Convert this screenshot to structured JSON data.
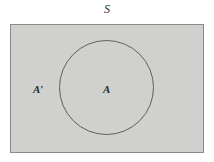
{
  "diagram": {
    "type": "set-diagram",
    "labels": {
      "universal_set": "S",
      "set_a": "A",
      "complement": "A′"
    },
    "colors": {
      "background": "#ffffff",
      "rect_fill": "#d0d0ce",
      "rect_border": "#8a8a8a",
      "circle_border": "#5f5f5f",
      "text": "#2b2b2b"
    }
  }
}
